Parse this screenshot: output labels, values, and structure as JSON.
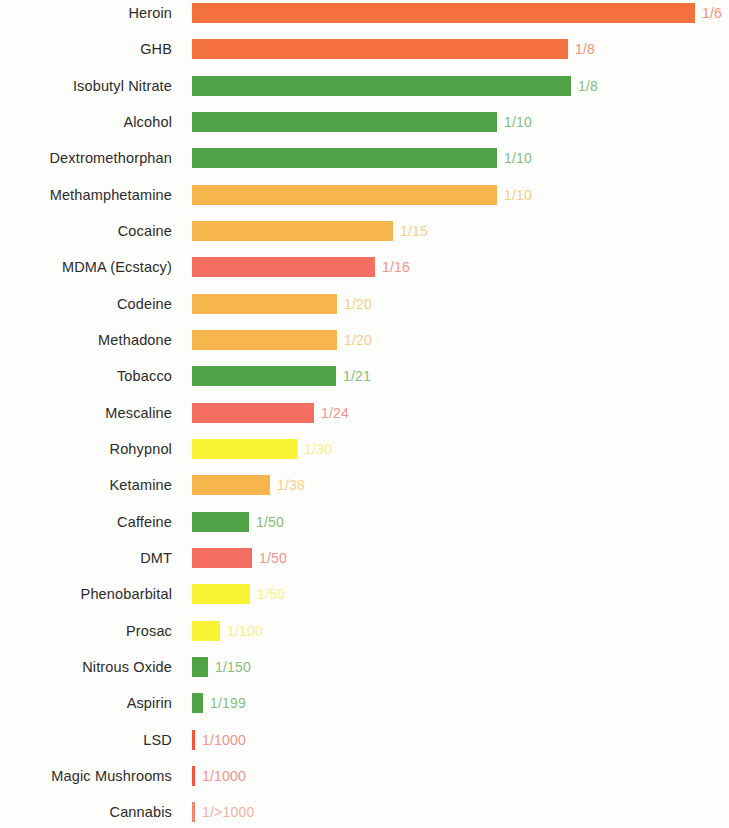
{
  "chart_data": {
    "type": "bar",
    "title": "",
    "subtitle": "",
    "xlabel": "",
    "ylabel": "",
    "orientation": "horizontal",
    "grid": false,
    "legend": "none",
    "axis_visible": false,
    "value_format": "ratio",
    "note": "Active dose to lethal dose ratio (safety ratio) for various substances; longer bar = smaller ratio denominator = less safe.",
    "colors": {
      "orange_red": "#F4703C",
      "green": "#4FA346",
      "amber": "#F7B64D",
      "salmon": "#F46E62",
      "yellow": "#F9F232",
      "label_tint_orange_red": "#F59476",
      "label_tint_green": "#86BE7C",
      "label_tint_amber": "#F6CE86",
      "label_tint_salmon": "#F4948B",
      "label_tint_yellow": "#F7F08A",
      "background": "#FDFDFC",
      "text": "#2B2B2B"
    },
    "categories": [
      "Heroin",
      "GHB",
      "Isobutyl Nitrate",
      "Alcohol",
      "Dextromethorphan",
      "Methamphetamine",
      "Cocaine",
      "MDMA (Ecstacy)",
      "Codeine",
      "Methadone",
      "Tobacco",
      "Mescaline",
      "Rohypnol",
      "Ketamine",
      "Caffeine",
      "DMT",
      "Phenobarbital",
      "Prosac",
      "Nitrous Oxide",
      "Aspirin",
      "LSD",
      "Magic Mushrooms",
      "Cannabis"
    ],
    "value_labels": [
      "1/6",
      "1/8",
      "1/8",
      "1/10",
      "1/10",
      "1/10",
      "1/15",
      "1/16",
      "1/20",
      "1/20",
      "1/21",
      "1/24",
      "1/30",
      "1/38",
      "1/50",
      "1/50",
      "1/50",
      "1/100",
      "1/150",
      "1/199",
      "1/1000",
      "1/1000",
      "1/>1000"
    ],
    "values": [
      6,
      8,
      8,
      10,
      10,
      10,
      15,
      16,
      20,
      20,
      21,
      24,
      30,
      38,
      50,
      50,
      50,
      100,
      150,
      199,
      1000,
      1000,
      1000
    ],
    "bar_pixel_lengths": [
      503,
      376,
      379,
      305,
      305,
      305,
      201,
      183,
      145,
      145,
      144,
      122,
      105,
      78,
      57,
      60,
      58,
      28,
      16,
      11,
      3,
      3,
      3
    ],
    "bar_colors": [
      "#F4703C",
      "#F4703C",
      "#4FA346",
      "#4FA346",
      "#4FA346",
      "#F7B64D",
      "#F7B64D",
      "#F46E62",
      "#F7B64D",
      "#F7B64D",
      "#4FA346",
      "#F46E62",
      "#F9F232",
      "#F7B64D",
      "#4FA346",
      "#F46E62",
      "#F9F232",
      "#F9F232",
      "#4FA346",
      "#4FA346",
      "#F4533C",
      "#F4533C",
      "#F4846E"
    ],
    "label_colors": [
      "#F59476",
      "#F59476",
      "#86BE7C",
      "#86BE7C",
      "#86BE7C",
      "#F6CE86",
      "#F6CE86",
      "#F4948B",
      "#F6CE86",
      "#F6CE86",
      "#86BE7C",
      "#F4948B",
      "#F7F08A",
      "#F6CE86",
      "#86BE7C",
      "#F4948B",
      "#F7F08A",
      "#F7F08A",
      "#86BE7C",
      "#86BE7C",
      "#F4948B",
      "#F4948B",
      "#F4B0A4"
    ],
    "row_tops": [
      3,
      39,
      76,
      112,
      148,
      185,
      221,
      257,
      294,
      330,
      366,
      403,
      439,
      475,
      512,
      548,
      584,
      621,
      657,
      693,
      730,
      766,
      802
    ]
  }
}
